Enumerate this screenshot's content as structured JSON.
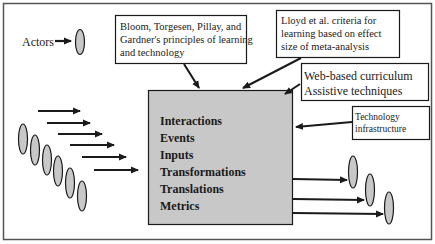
{
  "diagram": {
    "actors_label": "Actors",
    "boxes": {
      "bloom": {
        "lines": [
          "Bloom, Torgesen, Pillay, and",
          "Gardner's principles of learning",
          "and technology"
        ]
      },
      "lloyd": {
        "lines": [
          "Lloyd et al. criteria for",
          "learning based on effect",
          "size of meta-analysis"
        ]
      },
      "web": {
        "lines": [
          "Web-based curriculum",
          "Assistive techniques"
        ]
      },
      "tech": {
        "lines": [
          "Technology",
          "infrastructure"
        ]
      }
    },
    "central": {
      "items": [
        "Interactions",
        "Events",
        "Inputs",
        "Transformations",
        "Translations",
        "Metrics"
      ]
    },
    "colors": {
      "central_fill": "#c8c8c8",
      "ellipse_fill": "#c8c8c8",
      "stroke": "#1a1a1a",
      "border": "#555555"
    }
  }
}
